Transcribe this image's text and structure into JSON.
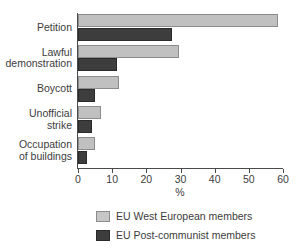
{
  "chart_data": {
    "type": "bar",
    "orientation": "horizontal",
    "title": "",
    "xlabel": "%",
    "ylabel": "",
    "xlim": [
      0,
      60
    ],
    "xticks": [
      0,
      10,
      20,
      30,
      40,
      50,
      60
    ],
    "xtick_labels": [
      "0",
      "10",
      "20",
      "30",
      "40",
      "50",
      "60"
    ],
    "grid": false,
    "legend_position": "bottom",
    "categories": [
      "Petition",
      "Lawful\ndemonstration",
      "Boycott",
      "Unofficial\nstrike",
      "Occupation\nof buildings"
    ],
    "series": [
      {
        "name": "EU West European members",
        "color": "#c0c0c0",
        "values": [
          58.5,
          29.7,
          12.0,
          6.8,
          5.0
        ]
      },
      {
        "name": "EU Post-communist members",
        "color": "#3d3d3d",
        "values": [
          27.6,
          11.5,
          5.0,
          4.0,
          2.5
        ]
      }
    ]
  },
  "legend": {
    "items": [
      {
        "label": "EU West European members"
      },
      {
        "label": "EU Post-communist members"
      }
    ]
  },
  "colors": {
    "west": "#c0c0c0",
    "post": "#3d3d3d",
    "axis": "#4a4a4a",
    "text": "#3c3c3c",
    "background": "#ffffff"
  }
}
